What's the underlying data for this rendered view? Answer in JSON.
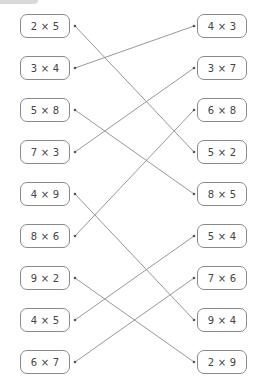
{
  "exercise": {
    "left_items": [
      "2 × 5",
      "3 × 4",
      "5 × 8",
      "7 × 3",
      "4 × 9",
      "8 × 6",
      "9 × 2",
      "4 × 5",
      "6 × 7"
    ],
    "right_items": [
      "4 × 3",
      "3 × 7",
      "6 × 8",
      "5 × 2",
      "8 × 5",
      "5 × 4",
      "7 × 6",
      "9 × 4",
      "2 × 9"
    ],
    "connections": [
      {
        "left": 0,
        "right": 3
      },
      {
        "left": 1,
        "right": 0
      },
      {
        "left": 2,
        "right": 4
      },
      {
        "left": 3,
        "right": 1
      },
      {
        "left": 4,
        "right": 7
      },
      {
        "left": 5,
        "right": 2
      },
      {
        "left": 6,
        "right": 8
      },
      {
        "left": 7,
        "right": 5
      },
      {
        "left": 8,
        "right": 6
      }
    ],
    "line_color": "#8c8c8c",
    "box_border_color": "#8a8a8a",
    "text_color": "#444444"
  }
}
